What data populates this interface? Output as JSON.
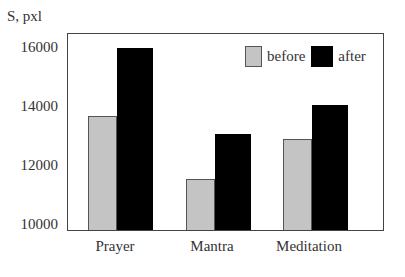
{
  "chart_data": {
    "type": "bar",
    "title": "",
    "xlabel": "",
    "ylabel": "S, pxl",
    "ylim": [
      10000,
      16600
    ],
    "yticks": [
      "16000",
      "14000",
      "12000",
      "10000"
    ],
    "categories": [
      "Prayer",
      "Mantra",
      "Meditation"
    ],
    "series": [
      {
        "name": "before",
        "color": "#c4c4c4",
        "values": [
          13700,
          11560,
          12920
        ]
      },
      {
        "name": "after",
        "color": "#000000",
        "values": [
          16000,
          13080,
          14070
        ]
      }
    ],
    "legend": {
      "position": "upper right",
      "entries": [
        "before",
        "after"
      ]
    },
    "grid": false
  }
}
